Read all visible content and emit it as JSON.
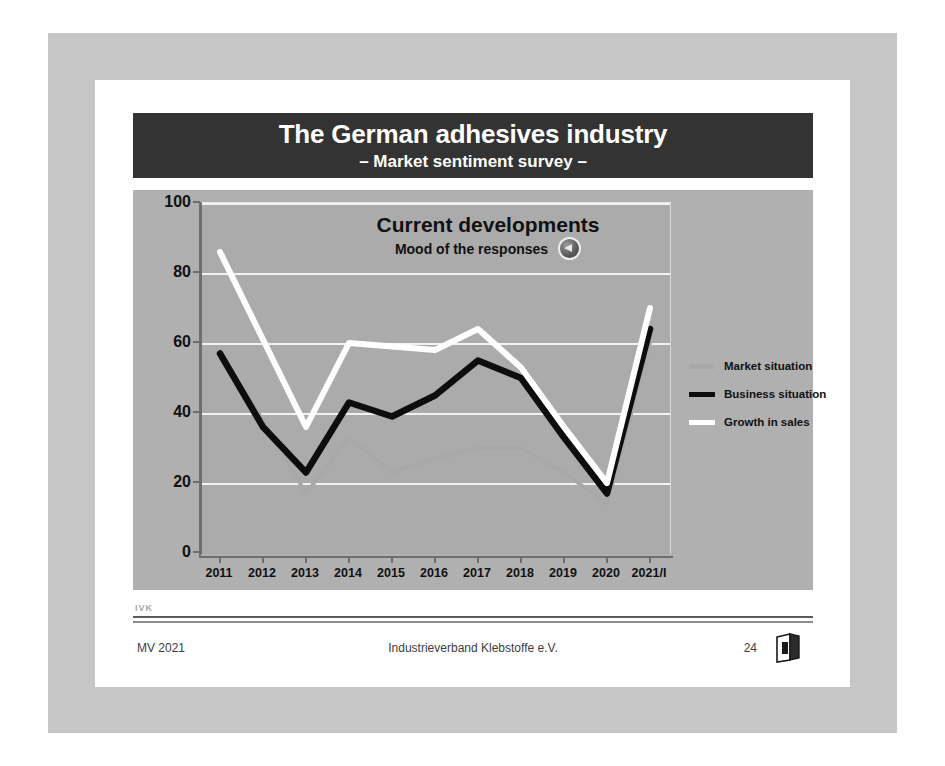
{
  "slide": {
    "title_main": "The German adhesives industry",
    "title_sub": "– Market sentiment survey –",
    "title_bg": "#333333"
  },
  "chart_heading": {
    "main": "Current developments",
    "sub": "Mood of the responses",
    "icon": "mood-trend-icon"
  },
  "legend": {
    "items": [
      {
        "label": "Market situation",
        "color": "#a8a8a8"
      },
      {
        "label": "Business situation",
        "color": "#0d0d0d"
      },
      {
        "label": "Growth in sales",
        "color": "#ffffff"
      }
    ]
  },
  "footer": {
    "mark": "IVK",
    "left": "MV 2021",
    "center": "Industrieverband Klebstoffe e.V.",
    "page": "24",
    "logo": "ivk-book-logo"
  },
  "chart_data": {
    "type": "line",
    "title": "Current developments",
    "subtitle": "Mood of the responses",
    "xlabel": "",
    "ylabel": "",
    "ylim": [
      0,
      100
    ],
    "yticks": [
      0,
      20,
      40,
      60,
      80,
      100
    ],
    "grid": true,
    "legend_position": "right",
    "categories": [
      "2011",
      "2012",
      "2013",
      "2014",
      "2015",
      "2016",
      "2017",
      "2018",
      "2019",
      "2020",
      "2021/I"
    ],
    "series": [
      {
        "name": "Market situation",
        "color": "#a8a8a8",
        "values": [
          57,
          38,
          17,
          33,
          23,
          27,
          30,
          30,
          23,
          14,
          60
        ]
      },
      {
        "name": "Business situation",
        "color": "#0d0d0d",
        "values": [
          57,
          36,
          23,
          43,
          39,
          45,
          55,
          50,
          33,
          17,
          64
        ]
      },
      {
        "name": "Growth in sales",
        "color": "#ffffff",
        "values": [
          86,
          61,
          36,
          60,
          59,
          58,
          64,
          53,
          36,
          20,
          70
        ]
      }
    ]
  }
}
